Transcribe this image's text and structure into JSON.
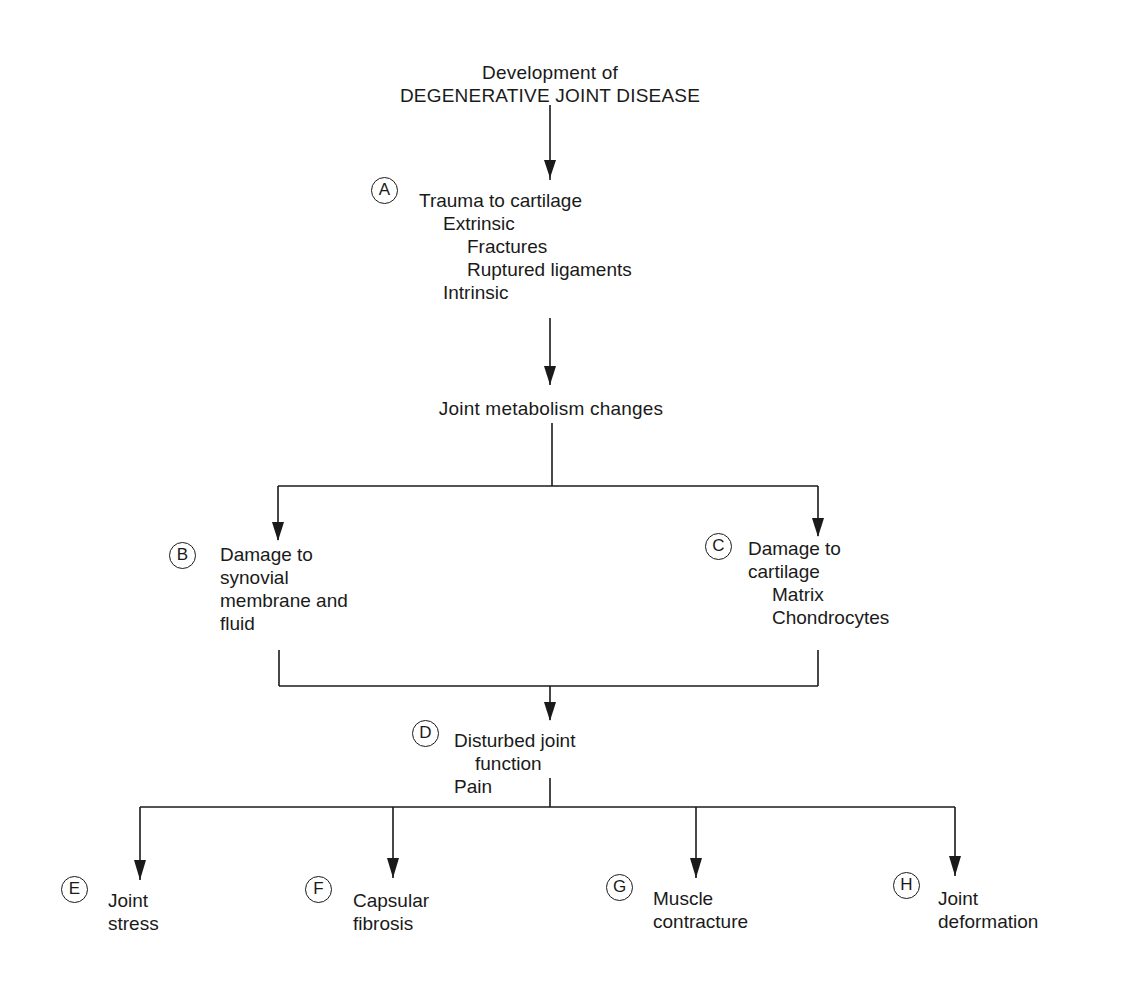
{
  "title": {
    "line1": "Development of",
    "line2": "DEGENERATIVE JOINT DISEASE"
  },
  "nodes": {
    "A": {
      "label": "A",
      "lines": [
        "Trauma to cartilage",
        "Extrinsic",
        "Fractures",
        "Ruptured ligaments",
        "Intrinsic"
      ],
      "indent_levels": [
        0,
        1,
        2,
        2,
        1
      ]
    },
    "metabolism": {
      "label": "",
      "lines": [
        "Joint metabolism changes"
      ]
    },
    "B": {
      "label": "B",
      "lines": [
        "Damage to",
        "synovial",
        "membrane and",
        "fluid"
      ]
    },
    "C": {
      "label": "C",
      "lines": [
        "Damage to",
        "cartilage",
        "Matrix",
        "Chondrocytes"
      ],
      "indent_levels": [
        0,
        0,
        1,
        1
      ]
    },
    "D": {
      "label": "D",
      "lines": [
        "Disturbed joint",
        "function",
        "Pain"
      ]
    },
    "E": {
      "label": "E",
      "lines": [
        "Joint",
        "stress"
      ]
    },
    "F": {
      "label": "F",
      "lines": [
        "Capsular",
        "fibrosis"
      ]
    },
    "G": {
      "label": "G",
      "lines": [
        "Muscle",
        "contracture"
      ]
    },
    "H": {
      "label": "H",
      "lines": [
        "Joint",
        "deformation"
      ]
    }
  },
  "edges": [
    [
      "title",
      "A"
    ],
    [
      "A",
      "metabolism"
    ],
    [
      "metabolism",
      "B"
    ],
    [
      "metabolism",
      "C"
    ],
    [
      "B",
      "D"
    ],
    [
      "C",
      "D"
    ],
    [
      "D",
      "E"
    ],
    [
      "D",
      "F"
    ],
    [
      "D",
      "G"
    ],
    [
      "D",
      "H"
    ]
  ],
  "colors": {
    "ink": "#1a1a1a",
    "background": "#ffffff"
  }
}
